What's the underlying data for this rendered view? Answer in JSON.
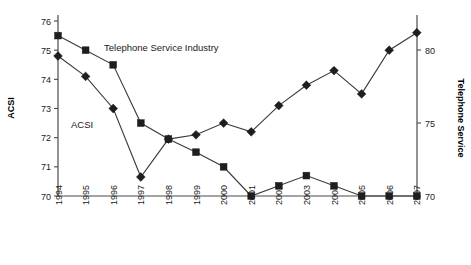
{
  "chart_data": {
    "type": "line",
    "title": "",
    "xlabel": "",
    "ylabel": "ACSI",
    "y2label": "Telephone Service",
    "grid": false,
    "legend_position": "inline-annotation",
    "categories": [
      "1994",
      "1995",
      "1996",
      "1997",
      "1998",
      "1999",
      "2000",
      "2001",
      "2002",
      "2003",
      "2004",
      "2005",
      "2006",
      "2007"
    ],
    "ylim": [
      70,
      76
    ],
    "yticks": [
      70,
      71,
      72,
      73,
      74,
      75,
      76
    ],
    "y2lim": [
      70,
      81.5
    ],
    "y2ticks": [
      70,
      75,
      80
    ],
    "series": [
      {
        "name": "ACSI",
        "marker": "diamond",
        "axis": "left",
        "values": [
          74.8,
          74.1,
          73.0,
          70.65,
          71.95,
          72.1,
          72.5,
          72.2,
          73.1,
          73.8,
          74.3,
          73.5,
          75.0,
          75.6
        ]
      },
      {
        "name": "Telephone Service Industry",
        "marker": "square",
        "axis": "left",
        "values": [
          75.5,
          75.0,
          74.5,
          72.5,
          71.95,
          71.5,
          71.0,
          70.0,
          70.35,
          70.7,
          70.35,
          70.0,
          70.0,
          70.0
        ]
      }
    ],
    "annotations": [
      {
        "text": "Telephone Service Industry",
        "x_px": 104,
        "y_px": 51
      },
      {
        "text": "ACSI",
        "x_px": 71,
        "y_px": 128
      }
    ]
  },
  "axes": {
    "left_title": "ACSI",
    "right_title": "Telephone Service",
    "left_ticks": [
      "76",
      "75",
      "74",
      "73",
      "72",
      "71",
      "70"
    ],
    "right_ticks": [
      "80",
      "75",
      "70"
    ]
  },
  "x_axis": {
    "labels": [
      "1994",
      "1995",
      "1996",
      "1997",
      "1998",
      "1999",
      "2000",
      "2001",
      "2002",
      "2003",
      "2004",
      "2005",
      "2006",
      "2007"
    ]
  }
}
